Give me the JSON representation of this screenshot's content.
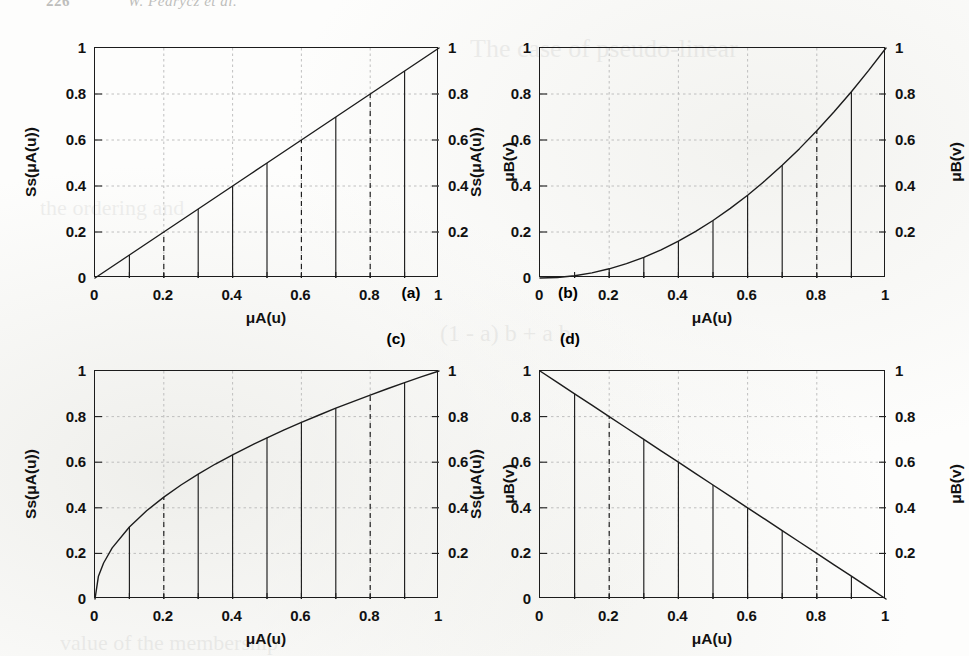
{
  "page": {
    "folio": "226",
    "running_head": "W. Pedrycz et al."
  },
  "figure": {
    "axis_title_x": "μA(u)",
    "axis_title_y_left": "Ss(μA(u))",
    "axis_title_y_right": "μB(v)",
    "x_ticks": [
      "0",
      "0.2",
      "0.4",
      "0.6",
      "0.8",
      "1"
    ],
    "y_ticks_left": [
      "0",
      "0.2",
      "0.4",
      "0.6",
      "0.8",
      "1"
    ],
    "y_ticks_right": [
      "0.2",
      "0.4",
      "0.6",
      "0.8",
      "1"
    ],
    "ink_color": "#1c1c1c",
    "grid_color": "#b9b9b9"
  },
  "chart_data": [
    {
      "type": "line",
      "panel": "a",
      "caption": "(a)",
      "title": "",
      "xlabel": "μA(u)",
      "ylabel": "Ss(μA(u))",
      "ylabel_right": "μB(v)",
      "xlim": [
        0,
        1
      ],
      "ylim": [
        0,
        1
      ],
      "grid": true,
      "grid_x": [
        0.2,
        0.4,
        0.6,
        0.8
      ],
      "grid_y": [
        0.2,
        0.4,
        0.6,
        0.8
      ],
      "relation": "identity: y = x",
      "x": [
        0,
        0.05,
        0.1,
        0.15,
        0.2,
        0.25,
        0.3,
        0.35,
        0.4,
        0.45,
        0.5,
        0.55,
        0.6,
        0.65,
        0.7,
        0.75,
        0.8,
        0.85,
        0.9,
        0.95,
        1
      ],
      "y": [
        0,
        0.05,
        0.1,
        0.15,
        0.2,
        0.25,
        0.3,
        0.35,
        0.4,
        0.45,
        0.5,
        0.55,
        0.6,
        0.65,
        0.7,
        0.75,
        0.8,
        0.85,
        0.9,
        0.95,
        1
      ],
      "dropline_x": [
        0.1,
        0.2,
        0.3,
        0.4,
        0.5,
        0.6,
        0.7,
        0.8,
        0.9
      ],
      "dropline_y": [
        0.1,
        0.2,
        0.3,
        0.4,
        0.5,
        0.6,
        0.7,
        0.8,
        0.9
      ],
      "dashed_droplines": [
        0.2,
        0.6,
        0.8
      ]
    },
    {
      "type": "line",
      "panel": "b",
      "caption": "(b)",
      "title": "",
      "xlabel": "μA(u)",
      "ylabel": "Ss(μA(u))",
      "ylabel_right": "μB(v)",
      "xlim": [
        0,
        1
      ],
      "ylim": [
        0,
        1
      ],
      "grid": true,
      "grid_x": [
        0.2,
        0.4,
        0.6,
        0.8
      ],
      "grid_y": [
        0.2,
        0.4,
        0.6,
        0.8
      ],
      "relation": "concentration: y = x^2",
      "x": [
        0,
        0.05,
        0.1,
        0.15,
        0.2,
        0.25,
        0.3,
        0.35,
        0.4,
        0.45,
        0.5,
        0.55,
        0.6,
        0.65,
        0.7,
        0.75,
        0.8,
        0.85,
        0.9,
        0.95,
        1
      ],
      "y": [
        0,
        0.0025,
        0.01,
        0.0225,
        0.04,
        0.0625,
        0.09,
        0.1225,
        0.16,
        0.2025,
        0.25,
        0.3025,
        0.36,
        0.4225,
        0.49,
        0.5625,
        0.64,
        0.7225,
        0.81,
        0.9025,
        1
      ],
      "dropline_x": [
        0.1,
        0.2,
        0.3,
        0.4,
        0.5,
        0.6,
        0.7,
        0.8,
        0.9
      ],
      "dropline_y": [
        0.01,
        0.04,
        0.09,
        0.16,
        0.25,
        0.36,
        0.49,
        0.64,
        0.81
      ],
      "dashed_droplines": [
        0.8
      ]
    },
    {
      "type": "line",
      "panel": "c",
      "caption": "(c)",
      "title": "",
      "xlabel": "μA(u)",
      "ylabel": "Ss(μA(u))",
      "ylabel_right": "μB(v)",
      "xlim": [
        0,
        1
      ],
      "ylim": [
        0,
        1
      ],
      "grid": true,
      "grid_x": [
        0.2,
        0.4,
        0.6,
        0.8
      ],
      "grid_y": [
        0.2,
        0.4,
        0.6,
        0.8
      ],
      "relation": "dilation: y = x^0.5",
      "x": [
        0,
        0.01,
        0.025,
        0.05,
        0.1,
        0.15,
        0.2,
        0.25,
        0.3,
        0.35,
        0.4,
        0.45,
        0.5,
        0.55,
        0.6,
        0.65,
        0.7,
        0.75,
        0.8,
        0.85,
        0.9,
        0.95,
        1
      ],
      "y": [
        0,
        0.1,
        0.158,
        0.224,
        0.316,
        0.387,
        0.447,
        0.5,
        0.548,
        0.592,
        0.632,
        0.671,
        0.707,
        0.742,
        0.775,
        0.806,
        0.837,
        0.866,
        0.894,
        0.922,
        0.949,
        0.975,
        1
      ],
      "dropline_x": [
        0.1,
        0.2,
        0.3,
        0.4,
        0.5,
        0.6,
        0.7,
        0.8,
        0.9
      ],
      "dropline_y": [
        0.316,
        0.447,
        0.548,
        0.632,
        0.707,
        0.775,
        0.837,
        0.894,
        0.949
      ],
      "dashed_droplines": [
        0.2,
        0.8
      ]
    },
    {
      "type": "line",
      "panel": "d",
      "caption": "(d)",
      "title": "",
      "xlabel": "μA(u)",
      "ylabel": "Ss(μA(u))",
      "ylabel_right": "μB(v)",
      "xlim": [
        0,
        1
      ],
      "ylim": [
        0,
        1
      ],
      "grid": true,
      "grid_x": [
        0.2,
        0.4,
        0.6,
        0.8
      ],
      "grid_y": [
        0.2,
        0.4,
        0.6,
        0.8
      ],
      "relation": "complement: y = 1 - x",
      "x": [
        0,
        0.05,
        0.1,
        0.15,
        0.2,
        0.25,
        0.3,
        0.35,
        0.4,
        0.45,
        0.5,
        0.55,
        0.6,
        0.65,
        0.7,
        0.75,
        0.8,
        0.85,
        0.9,
        0.95,
        1
      ],
      "y": [
        1,
        0.95,
        0.9,
        0.85,
        0.8,
        0.75,
        0.7,
        0.65,
        0.6,
        0.55,
        0.5,
        0.45,
        0.4,
        0.35,
        0.3,
        0.25,
        0.2,
        0.15,
        0.1,
        0.05,
        0
      ],
      "dropline_x": [
        0.1,
        0.2,
        0.3,
        0.4,
        0.5,
        0.6,
        0.7,
        0.8,
        0.9
      ],
      "dropline_y": [
        0.9,
        0.8,
        0.7,
        0.6,
        0.5,
        0.4,
        0.3,
        0.2,
        0.1
      ],
      "dashed_droplines": [
        0.2,
        0.8
      ]
    }
  ]
}
